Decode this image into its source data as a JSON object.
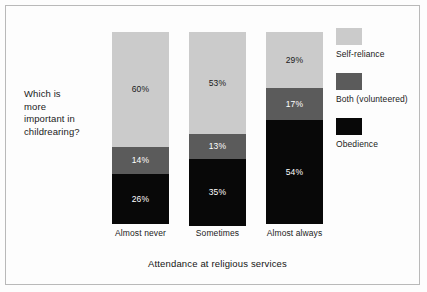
{
  "chart_data": {
    "type": "bar",
    "subtype": "stacked-100-percent",
    "orientation": "vertical",
    "title": "",
    "xlabel": "Attendance at religious services",
    "ylabel": "",
    "ylim": [
      0,
      100
    ],
    "grid": false,
    "legend_position": "right",
    "categories": [
      "Almost never",
      "Sometimes",
      "Almost always"
    ],
    "series": [
      {
        "name": "Self-reliance",
        "color": "#cbcbcb",
        "label_color": "#1a1a1a",
        "values": [
          60,
          53,
          29
        ],
        "labels": [
          "60%",
          "53%",
          "29%"
        ]
      },
      {
        "name": "Both (volunteered)",
        "color": "#5b5b5b",
        "label_color": "#ffffff",
        "values": [
          14,
          13,
          17
        ],
        "labels": [
          "14%",
          "13%",
          "17%"
        ]
      },
      {
        "name": "Obedience",
        "color": "#080808",
        "label_color": "#ffffff",
        "values": [
          26,
          35,
          54
        ],
        "labels": [
          "26%",
          "35%",
          "54%"
        ]
      }
    ],
    "annotations": {
      "question": "Which is more important in childrearing?"
    }
  },
  "question": {
    "line1": "Which is",
    "line2": "more",
    "line3": "important in",
    "line4": "childrearing?"
  },
  "axis": {
    "x_title": "Attendance at religious services",
    "tick_0": "Almost never",
    "tick_1": "Sometimes",
    "tick_2": "Almost always"
  },
  "legend": {
    "items": [
      {
        "label": "Self-reliance",
        "color": "#cbcbcb"
      },
      {
        "label": "Both (volunteered)",
        "color": "#5b5b5b"
      },
      {
        "label": "Obedience",
        "color": "#080808"
      }
    ]
  },
  "labels": {
    "b0s0": "60%",
    "b0s1": "14%",
    "b0s2": "26%",
    "b1s0": "53%",
    "b1s1": "13%",
    "b1s2": "35%",
    "b2s0": "29%",
    "b2s1": "17%",
    "b2s2": "54%"
  },
  "colors": {
    "self_reliance": "#cbcbcb",
    "both": "#5b5b5b",
    "obedience": "#080808",
    "frame": "#b9b9b9",
    "background": "#fdfdfd"
  }
}
